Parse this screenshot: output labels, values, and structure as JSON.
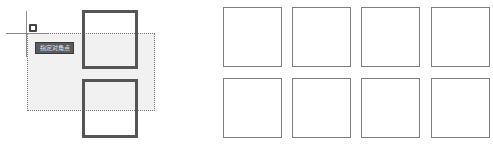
{
  "canvas": {
    "background": "#ffffff",
    "selection_window": {
      "type": "crossing",
      "fill": "#f1f1f1",
      "border": "dotted"
    },
    "cursor": {
      "type": "crosshair-with-pickbox"
    },
    "tooltip": {
      "text": "指定对角点"
    },
    "left_group": {
      "squares": [
        {
          "label": "",
          "style": "highlighted"
        },
        {
          "label": "",
          "style": "highlighted"
        }
      ]
    },
    "right_group": {
      "rows": 2,
      "cols": 4,
      "squares": [
        {
          "label": ""
        },
        {
          "label": ""
        },
        {
          "label": ""
        },
        {
          "label": ""
        },
        {
          "label": ""
        },
        {
          "label": ""
        },
        {
          "label": ""
        },
        {
          "label": ""
        }
      ]
    }
  },
  "colors": {
    "highlight_border": "#555555",
    "normal_border": "#7d7d7d",
    "tooltip_bg": "#5b5b5b"
  }
}
